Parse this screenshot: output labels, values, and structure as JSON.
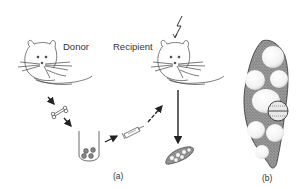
{
  "figure": {
    "labels": {
      "donor": "Donor",
      "recipient": "Recipient"
    },
    "panels": {
      "a": "(a)",
      "b": "(b)"
    },
    "elements": [
      {
        "name": "donor-mouse",
        "description": "line drawing of a mouse, upper left"
      },
      {
        "name": "recipient-mouse",
        "description": "line drawing of a mouse, upper middle"
      },
      {
        "name": "lightning-bolt",
        "description": "irradiation symbol above recipient"
      },
      {
        "name": "bone",
        "description": "bone extracted from donor"
      },
      {
        "name": "test-tube",
        "description": "tube containing marrow cells"
      },
      {
        "name": "syringe",
        "description": "injection into recipient"
      },
      {
        "name": "spleen-small",
        "description": "spleen with colonies, bottom of (a)"
      },
      {
        "name": "spleen-enlarged",
        "description": "enlarged spleen with nodules, panel (b)"
      }
    ],
    "colors": {
      "line": "#333333",
      "spleen_fill": "#8a8a8a",
      "nodule_fill": "#f4f4f4",
      "background": "#ffffff"
    }
  }
}
